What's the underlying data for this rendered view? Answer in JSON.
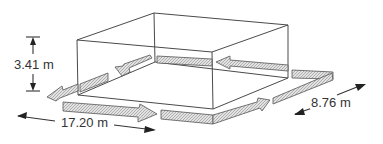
{
  "diagram": {
    "type": "isometric-box-with-flow-arrows",
    "dimensions": {
      "height": "3.41 m",
      "length": "17.20 m",
      "width": "8.76 m"
    },
    "colors": {
      "line": "#4a4a4a",
      "band_fill": "#d4d4d4",
      "background": "#ffffff"
    },
    "flow": {
      "description": "Hatched arrows circulate around the base of the box: along the front toward the right, along the right side toward the back, along the back toward the left, and along the left side toward the front."
    }
  }
}
